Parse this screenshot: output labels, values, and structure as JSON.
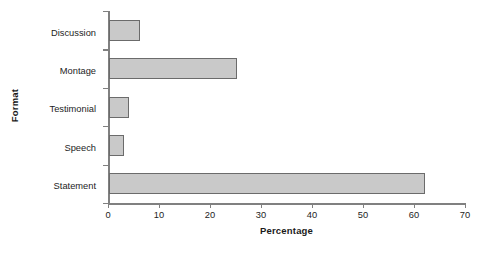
{
  "chart_data": {
    "type": "bar",
    "orientation": "horizontal",
    "title": "",
    "subtitle": "",
    "xlabel": "Percentage",
    "ylabel": "Format",
    "categories": [
      "Statement",
      "Speech",
      "Testimonial",
      "Montage",
      "Discussion"
    ],
    "values": [
      62,
      3,
      4,
      25,
      6
    ],
    "series": [
      {
        "name": "Percentage",
        "values": [
          62,
          3,
          4,
          25,
          6
        ]
      }
    ],
    "xlim": [
      0,
      70
    ],
    "xticks": [
      0,
      10,
      20,
      30,
      40,
      50,
      60,
      70
    ],
    "xtick_labels": [
      "0",
      "10",
      "20",
      "30",
      "40",
      "50",
      "60",
      "70"
    ],
    "ytick_labels_top_to_bottom": [
      "Discussion",
      "Montage",
      "Testimonial",
      "Speech",
      "Statement"
    ],
    "grid": false,
    "legend": "none",
    "colors": {
      "bar_fill": "#c9c9c9",
      "bar_edge": "#6b6b6b",
      "axis": "#808080",
      "text": "#1d1d1d",
      "background": "#ffffff"
    }
  }
}
